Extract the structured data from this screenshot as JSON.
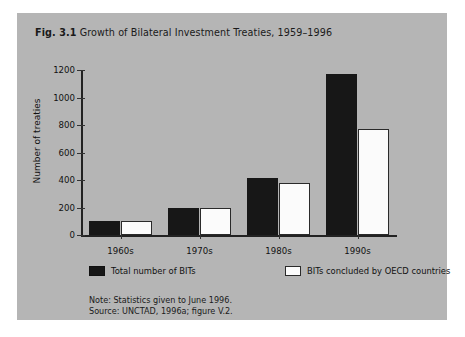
{
  "figure": {
    "number": "Fig. 3.1",
    "title": "Growth of Bilateral Investment Treaties, 1959–1996",
    "note": "Note: Statistics given to June 1996.",
    "source": "Source: UNCTAD, 1996a; figure V.2.",
    "panel_color": "#b5b5b5"
  },
  "chart_data": {
    "type": "bar",
    "title": "Growth of Bilateral Investment Treaties, 1959–1996",
    "xlabel": "",
    "ylabel": "Number of treaties",
    "categories": [
      "1960s",
      "1970s",
      "1980s",
      "1990s"
    ],
    "series": [
      {
        "name": "Total number of BITs",
        "color": "#171717",
        "values": [
          100,
          200,
          415,
          1170
        ]
      },
      {
        "name": "BITs concluded by OECD countries",
        "color": "#fbfbfb",
        "values": [
          100,
          195,
          375,
          770
        ]
      }
    ],
    "ylim": [
      0,
      1200
    ],
    "yticks": [
      0,
      200,
      400,
      600,
      800,
      1000,
      1200
    ],
    "ytick_labels": [
      "0",
      "200",
      "400",
      "600",
      "800",
      "1000",
      "1200"
    ],
    "grid": false,
    "legend_position": "bottom"
  }
}
